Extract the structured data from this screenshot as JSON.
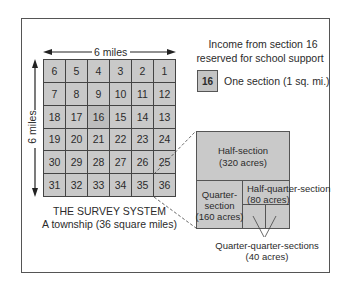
{
  "diagram": {
    "title": "THE SURVEY SYSTEM",
    "subtitle": "A township (36 square miles)",
    "width_label": "6 miles",
    "height_label": "6 miles",
    "township_rows": [
      [
        "6",
        "5",
        "4",
        "3",
        "2",
        "1"
      ],
      [
        "7",
        "8",
        "9",
        "10",
        "11",
        "12"
      ],
      [
        "18",
        "17",
        "16",
        "15",
        "14",
        "13"
      ],
      [
        "19",
        "20",
        "21",
        "22",
        "23",
        "24"
      ],
      [
        "30",
        "29",
        "28",
        "27",
        "26",
        "25"
      ],
      [
        "31",
        "32",
        "33",
        "34",
        "35",
        "36"
      ]
    ],
    "school_section": "16",
    "legend": {
      "note_line1": "Income from section 16",
      "note_line2": "reserved for school support",
      "box_label": "16",
      "box_description": "One section (1 sq. mi.)"
    },
    "section_breakdown": {
      "half_section": {
        "name": "Half-section",
        "acres": "(320 acres)"
      },
      "quarter_section": {
        "name_line1": "Quarter-",
        "name_line2": "section",
        "acres": "(160 acres)"
      },
      "half_quarter_section": {
        "name": "Half-quarter-section",
        "acres": "(80 acres)"
      },
      "quarter_quarter_sections": {
        "name": "Quarter-quarter-sections",
        "acres": "(40 acres)"
      }
    },
    "colors": {
      "cell_fill": "#c9c9c9",
      "line": "#444444",
      "text": "#2b2b2b"
    }
  }
}
